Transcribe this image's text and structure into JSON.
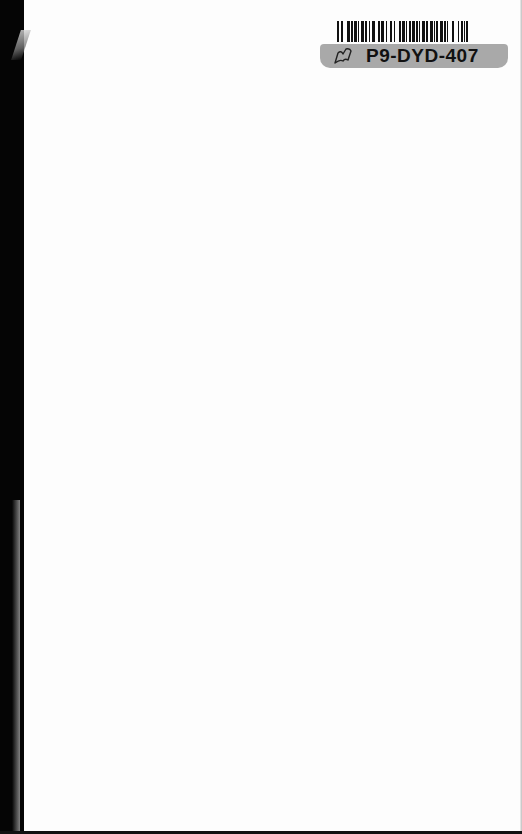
{
  "page": {
    "type": "blank scanned book page",
    "background_color": "#fdfdfd",
    "spine_color": "#050505"
  },
  "sticker": {
    "barcode_icon": "barcode",
    "label_icon": "book-outline-icon",
    "code": "P9-DYD-407",
    "label_color": "#a9a9a9"
  }
}
